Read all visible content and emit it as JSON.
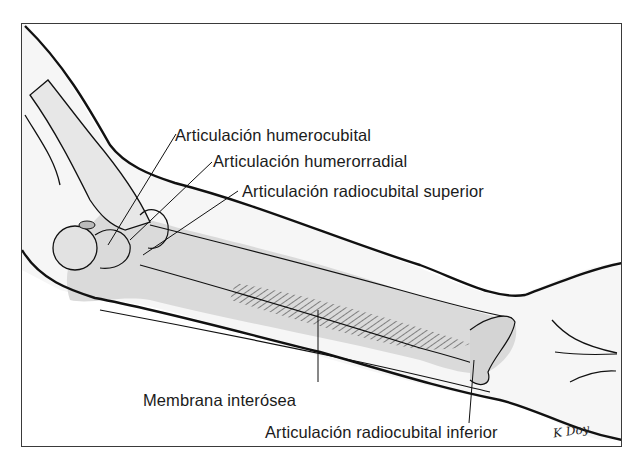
{
  "figure": {
    "colors": {
      "frame": "#3a3a3a",
      "outline": "#111111",
      "skin_fill": "#f4f4f4",
      "bone_fill": "#d9d9d9",
      "membrane_hatch": "#333333",
      "label_text": "#1b1b1b"
    }
  },
  "labels": [
    {
      "id": "humerocubital",
      "text": "Articulación humerocubital"
    },
    {
      "id": "humerorradial",
      "text": "Articulación humerorradial"
    },
    {
      "id": "radiocubital_superior",
      "text": "Articulación radiocubital superior"
    },
    {
      "id": "membrana_interosea",
      "text": "Membrana interósea"
    },
    {
      "id": "radiocubital_inferior",
      "text": "Articulación radiocubital inferior"
    }
  ],
  "signature": "K Doy"
}
